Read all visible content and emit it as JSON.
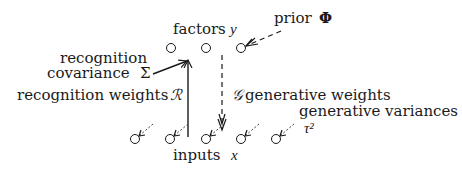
{
  "diagram": {
    "labels": {
      "factors": "factors",
      "factors_var": "y",
      "prior": "prior",
      "prior_symbol": "Φ",
      "recognition_covariance_line1": "recognition",
      "recognition_covariance_line2": "covariance",
      "recognition_covariance_symbol": "Σ",
      "recognition_weights": "recognition weights",
      "recognition_weights_symbol": "ℛ",
      "generative_weights_symbol": "𝒢",
      "generative_weights": "generative weights",
      "generative_variances": "generative variances",
      "generative_variances_symbol": "τ²",
      "inputs": "inputs",
      "inputs_var": "x"
    },
    "factor_nodes": [
      {
        "id": "y1"
      },
      {
        "id": "y2"
      },
      {
        "id": "y3"
      }
    ],
    "input_nodes": [
      {
        "id": "x1"
      },
      {
        "id": "x2"
      },
      {
        "id": "x3"
      },
      {
        "id": "x4"
      },
      {
        "id": "x5"
      }
    ],
    "edges": [
      {
        "from": "inputs",
        "to": "factors",
        "label": "recognition weights",
        "style": "solid"
      },
      {
        "from": "recognition covariance",
        "to": "factors",
        "label": "recognition covariance",
        "style": "solid"
      },
      {
        "from": "factors",
        "to": "inputs",
        "label": "generative weights",
        "style": "dashed"
      },
      {
        "from": "prior",
        "to": "factors",
        "label": "prior",
        "style": "dashed"
      },
      {
        "from": "generative variances",
        "to": "inputs",
        "label": "generative variances",
        "style": "dashed"
      }
    ]
  }
}
